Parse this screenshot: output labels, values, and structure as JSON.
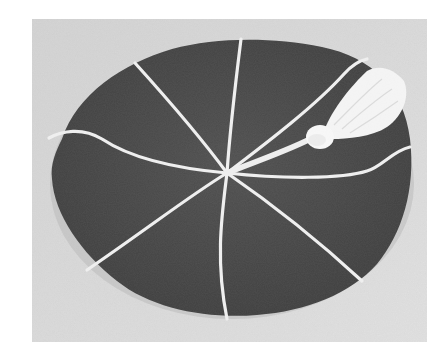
{
  "image": {
    "subject": "Round cap with radiating cord seams and a tassel",
    "alt": "Grayscale photograph of a dark round cap with eight white cord seams radiating from the center and a white tassel",
    "colors": {
      "page_background": "#ffffff",
      "backdrop": "#dcdcdc",
      "backdrop_shade": "#c8c8c8",
      "cap_fabric": "#4a4a4a",
      "cap_shadow": "#3a3a3a",
      "cord": "#f2f2f2",
      "tassel": "#f7f7f7"
    },
    "seam_count": 8
  }
}
